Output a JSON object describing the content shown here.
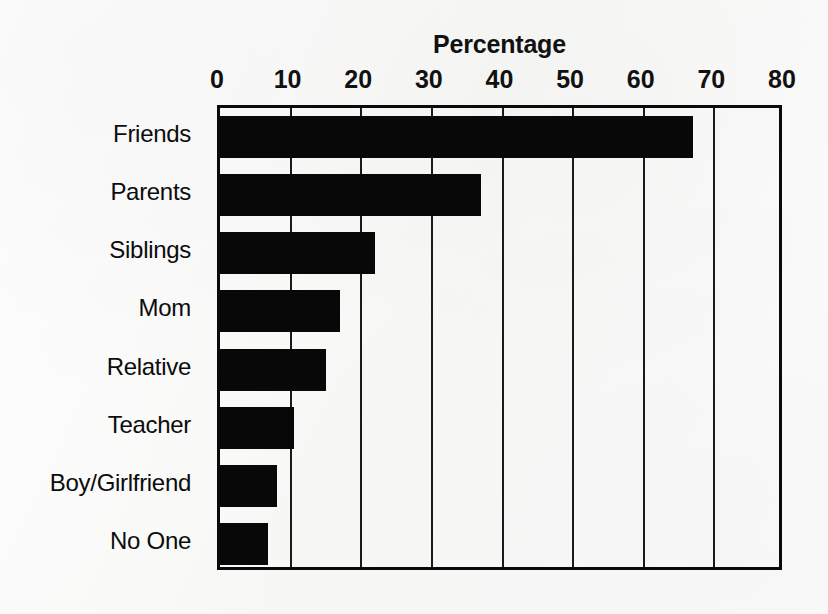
{
  "chart_data": {
    "type": "bar",
    "orientation": "horizontal",
    "title": "Percentage",
    "xlabel": "",
    "ylabel": "",
    "categories": [
      "Friends",
      "Parents",
      "Siblings",
      "Mom",
      "Relative",
      "Teacher",
      "Boy/Girlfriend",
      "No One"
    ],
    "values": [
      67,
      37,
      22,
      17,
      15,
      10.5,
      8,
      6.8
    ],
    "xlim": [
      0,
      80
    ],
    "xticks": [
      0,
      10,
      20,
      30,
      40,
      50,
      60,
      70,
      80
    ],
    "xtick_labels": [
      "0",
      "10",
      "20",
      "30",
      "40",
      "50",
      "60",
      "70",
      "80"
    ],
    "grid": "vertical",
    "legend": "none",
    "bar_color": "#080808",
    "axis_color": "#0a0a0a",
    "background_color": "#fbfbfb"
  }
}
